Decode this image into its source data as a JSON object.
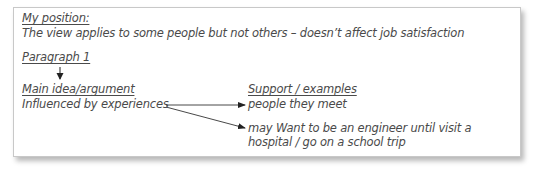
{
  "note": {
    "position_heading": "My position:",
    "position_text": "The view applies to some people but not others – doesn’t affect job satisfaction",
    "paragraph_heading": "Paragraph 1",
    "main_idea_heading": "Main idea/argument",
    "main_idea_text": "Influenced by experiences",
    "support_heading": "Support / examples",
    "support_items": [
      "people they meet",
      "may Want to be an engineer until visit a",
      "hospital / go on a school trip"
    ]
  },
  "colors": {
    "text": "#4a4a4a",
    "arrow": "#222222",
    "border": "#c8c8c8"
  }
}
